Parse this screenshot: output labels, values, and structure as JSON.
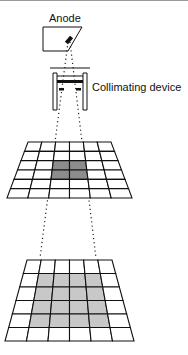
{
  "diagram": {
    "labels": {
      "anode": "Anode",
      "collimator": "Collimating device"
    },
    "grids": [
      {
        "name": "upper-detector-grid",
        "rows": 6,
        "cols": 6,
        "shaded": {
          "row_start": 2,
          "row_end": 3,
          "col_start": 2,
          "col_end": 3
        },
        "shade_color": "#8c8c8c"
      },
      {
        "name": "lower-detector-grid",
        "rows": 6,
        "cols": 6,
        "shaded": {
          "row_start": 1,
          "row_end": 4,
          "col_start": 1,
          "col_end": 4
        },
        "shade_color": "#c8c8c8"
      }
    ],
    "colors": {
      "line": "#111111",
      "beam": "#222222"
    }
  }
}
